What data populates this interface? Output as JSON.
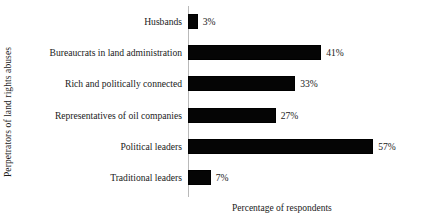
{
  "chart_data": {
    "type": "bar",
    "orientation": "horizontal",
    "title": "",
    "xlabel": "Percentage of respondents",
    "ylabel": "Perpetrators of land rights abuses",
    "categories": [
      "Husbands",
      "Bureaucrats in land administration",
      "Rich and politically connected",
      "Representatives of oil companies",
      "Political leaders",
      "Traditional leaders"
    ],
    "values": [
      3,
      41,
      33,
      27,
      57,
      7
    ],
    "value_labels": [
      "3%",
      "41%",
      "33%",
      "27%",
      "57%",
      "7%"
    ],
    "xlim": [
      0,
      57
    ],
    "grid": false,
    "legend": false,
    "bar_color": "#050505",
    "axis_color": "#b9b9b9",
    "background_color": "#ffffff"
  }
}
